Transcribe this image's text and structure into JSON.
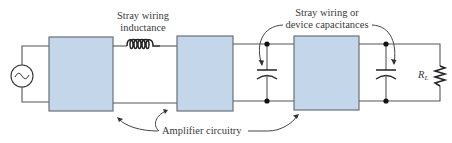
{
  "diagram": {
    "colors": {
      "block_fill": "#c4d6ea",
      "block_stroke": "#6a6f78",
      "wire": "#555555",
      "text": "#3a3a3a"
    },
    "labels": {
      "inductance_line1": "Stray wiring",
      "inductance_line2": "inductance",
      "capacitance_line1": "Stray wiring or",
      "capacitance_line2": "device capacitances",
      "amplifier": "Amplifier circuitry",
      "load_main": "R",
      "load_sub": "L"
    },
    "components": [
      {
        "id": "ac-source",
        "type": "voltage-source-ac"
      },
      {
        "id": "amp-block-1",
        "type": "block"
      },
      {
        "id": "stray-inductor",
        "type": "inductor"
      },
      {
        "id": "amp-block-2",
        "type": "block"
      },
      {
        "id": "stray-capacitor-1",
        "type": "capacitor"
      },
      {
        "id": "amp-block-3",
        "type": "block"
      },
      {
        "id": "stray-capacitor-2",
        "type": "capacitor"
      },
      {
        "id": "load-resistor",
        "type": "resistor",
        "label": "RL"
      }
    ]
  }
}
